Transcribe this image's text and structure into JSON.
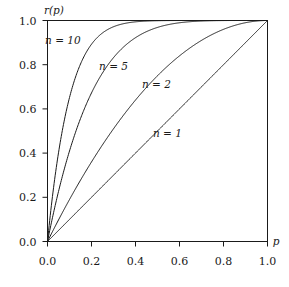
{
  "chart_data": {
    "type": "line",
    "title": "",
    "subtitle": "",
    "xlabel": "p",
    "ylabel": "r(p)",
    "xlim": [
      0.0,
      1.0
    ],
    "ylim": [
      0.0,
      1.0
    ],
    "grid": false,
    "legend_position": "inline-annotations",
    "formula": "r(p) = 1 - (1 - p)^n",
    "xticks": [
      "0.0",
      "0.2",
      "0.4",
      "0.6",
      "0.8",
      "1.0"
    ],
    "xtick_values": [
      0.0,
      0.2,
      0.4,
      0.6,
      0.8,
      1.0
    ],
    "yticks": [
      "0.0",
      "0.2",
      "0.4",
      "0.6",
      "0.8",
      "1.0"
    ],
    "ytick_values": [
      0.0,
      0.2,
      0.4,
      0.6,
      0.8,
      1.0
    ],
    "x": [
      0.0,
      0.05,
      0.1,
      0.15,
      0.2,
      0.25,
      0.3,
      0.35,
      0.4,
      0.45,
      0.5,
      0.55,
      0.6,
      0.65,
      0.7,
      0.75,
      0.8,
      0.85,
      0.9,
      0.95,
      1.0
    ],
    "series": [
      {
        "name": "n = 10",
        "n": 10,
        "label": "n = 10",
        "label_x": 0.07,
        "label_y": 0.895,
        "values": [
          0.0,
          0.401,
          0.651,
          0.803,
          0.893,
          0.944,
          0.972,
          0.987,
          0.994,
          0.997,
          0.999,
          1.0,
          1.0,
          1.0,
          1.0,
          1.0,
          1.0,
          1.0,
          1.0,
          1.0,
          1.0
        ]
      },
      {
        "name": "n = 5",
        "n": 5,
        "label": "n = 5",
        "label_x": 0.3,
        "label_y": 0.775,
        "values": [
          0.0,
          0.226,
          0.41,
          0.556,
          0.672,
          0.763,
          0.832,
          0.884,
          0.922,
          0.95,
          0.969,
          0.982,
          0.99,
          0.995,
          0.998,
          0.999,
          1.0,
          1.0,
          1.0,
          1.0,
          1.0
        ]
      },
      {
        "name": "n = 2",
        "n": 2,
        "label": "n = 2",
        "label_x": 0.495,
        "label_y": 0.695,
        "values": [
          0.0,
          0.098,
          0.19,
          0.278,
          0.36,
          0.438,
          0.51,
          0.578,
          0.64,
          0.698,
          0.75,
          0.798,
          0.84,
          0.878,
          0.91,
          0.938,
          0.96,
          0.978,
          0.99,
          0.998,
          1.0
        ]
      },
      {
        "name": "n = 1",
        "n": 1,
        "label": "n = 1",
        "label_x": 0.545,
        "label_y": 0.475,
        "values": [
          0.0,
          0.05,
          0.1,
          0.15,
          0.2,
          0.25,
          0.3,
          0.35,
          0.4,
          0.45,
          0.5,
          0.55,
          0.6,
          0.65,
          0.7,
          0.75,
          0.8,
          0.85,
          0.9,
          0.95,
          1.0
        ]
      }
    ],
    "colors": {
      "curve": "#1a1a1a",
      "axis": "#1a1a1a",
      "background": "#ffffff",
      "text": "#1a1a1a"
    }
  }
}
